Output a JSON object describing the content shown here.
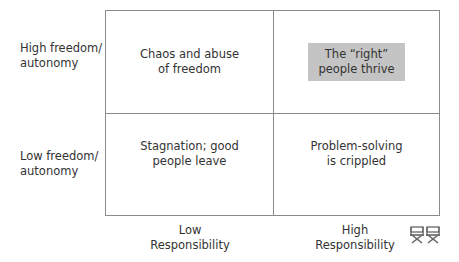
{
  "diagram": {
    "type": "2x2 matrix",
    "y_axis": {
      "high_label": [
        "High freedom/",
        "autonomy"
      ],
      "low_label": [
        "Low freedom/",
        "autonomy"
      ]
    },
    "x_axis": {
      "low_label": [
        "Low",
        "Responsibility"
      ],
      "high_label": [
        "High",
        "Responsibility"
      ]
    },
    "quadrants": {
      "high_freedom_low_responsibility": [
        "Chaos and abuse",
        "of freedom"
      ],
      "high_freedom_high_responsibility": [
        "The “right”",
        "people thrive"
      ],
      "low_freedom_low_responsibility": [
        "Stagnation; good",
        "people leave"
      ],
      "low_freedom_high_responsibility": [
        "Problem-solving",
        "is crippled"
      ]
    },
    "highlighted_quadrant": "high_freedom_high_responsibility",
    "colors": {
      "highlight": "#c4c4c4",
      "border": "#8a8a8a",
      "text": "#333333"
    },
    "icons": [
      "director-chair-icon",
      "director-chair-icon"
    ]
  }
}
